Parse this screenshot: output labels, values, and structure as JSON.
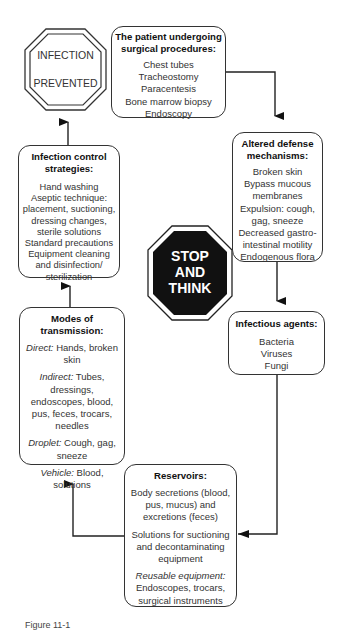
{
  "diagram": {
    "stop_sign_top": {
      "line1": "INFECTION",
      "line2": "PREVENTED"
    },
    "stop_sign_center": {
      "line1": "STOP",
      "line2": "AND",
      "line3": "THINK"
    },
    "patient_box": {
      "title": "The patient undergoing surgical procedures:",
      "items": [
        "Chest tubes",
        "Tracheostomy",
        "Paracentesis",
        "Bone marrow biopsy",
        "Endoscopy"
      ]
    },
    "defense_box": {
      "title": "Altered defense mechanisms:",
      "items": [
        "Broken skin",
        "Bypass mucous membranes",
        "Expulsion: cough, gag, sneeze",
        "Decreased gastro-intestinal motility",
        "Endogenous flora"
      ]
    },
    "agents_box": {
      "title": "Infectious agents:",
      "items": [
        "Bacteria",
        "Viruses",
        "Fungi"
      ]
    },
    "reservoirs_box": {
      "title": "Reservoirs:",
      "p1": "Body secretions (blood, pus, mucus) and excretions (feces)",
      "p2": "Solutions for suctioning and decontaminating equipment",
      "p3_label": "Reusable equipment:",
      "p3": "Endoscopes, trocars, surgical instruments"
    },
    "transmission_box": {
      "title": "Modes of transmission:",
      "direct_label": "Direct:",
      "direct": "Hands, broken skin",
      "indirect_label": "Indirect:",
      "indirect": "Tubes, dressings, endoscopes, blood, pus, feces, trocars, needles",
      "droplet_label": "Droplet:",
      "droplet": "Cough, gag, sneeze",
      "vehicle_label": "Vehicle:",
      "vehicle": "Blood, solutions"
    },
    "strategies_box": {
      "title": "Infection control strategies:",
      "items": [
        "Hand washing",
        "Aseptic technique: placement, suctioning, dressing changes, sterile solutions",
        "Standard precautions",
        "Equipment cleaning and disinfection/ sterilization"
      ]
    },
    "caption": "Figure 11-1"
  }
}
